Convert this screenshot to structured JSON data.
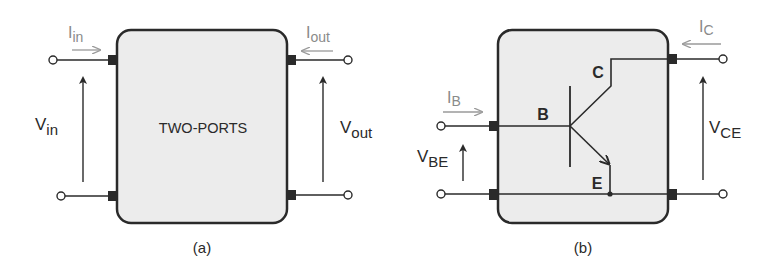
{
  "colors": {
    "box_fill": "#ececec",
    "stroke": "#2a2a2a",
    "current_arrow": "#9a9a9a",
    "port_square": "#2a2a2a"
  },
  "panel_a": {
    "box_label": "TWO-PORTS",
    "caption": "(a)",
    "i_in": {
      "main": "I",
      "sub": "in"
    },
    "i_out": {
      "main": "I",
      "sub": "out"
    },
    "v_in": {
      "main": "V",
      "sub": "in"
    },
    "v_out": {
      "main": "V",
      "sub": "out"
    }
  },
  "panel_b": {
    "caption": "(b)",
    "i_b": {
      "main": "I",
      "sub": "B"
    },
    "i_c": {
      "main": "I",
      "sub": "C"
    },
    "v_be": {
      "main": "V",
      "sub": "BE"
    },
    "v_ce": {
      "main": "V",
      "sub": "CE"
    },
    "transistor": {
      "base_label": "B",
      "collector_label": "C",
      "emitter_label": "E"
    }
  }
}
